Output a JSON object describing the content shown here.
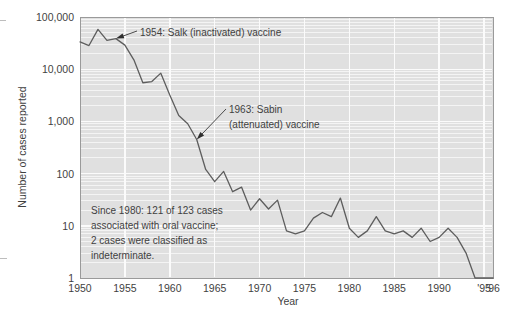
{
  "figure": {
    "title": "",
    "y_axis_title": "Number of cases reported",
    "x_axis_title": "Year"
  },
  "annotations": {
    "salk": "1954: Salk (inactivated) vaccine",
    "sabin_line1": "1963: Sabin",
    "sabin_line2": "(attenuated) vaccine",
    "note_line1": "Since 1980: 121 of 123 cases",
    "note_line2": "associated with oral vaccine;",
    "note_line3": "2 cases were classified as",
    "note_line4": "indeterminate."
  },
  "colors": {
    "plot_background": "#e0e0e0",
    "gridline": "#f4f4f4",
    "frame": "#9a9a9a",
    "series_line": "#5d5d5d",
    "text": "#3f3f3f",
    "page_background": "#ffffff"
  },
  "chart_data": {
    "type": "line",
    "title": "",
    "xlabel": "Year",
    "ylabel": "Number of cases reported",
    "yscale": "log",
    "ylim": [
      1,
      100000
    ],
    "xlim": [
      1950,
      1996
    ],
    "grid": true,
    "legend": "none",
    "ytick_labels": [
      "1",
      "10",
      "100",
      "1,000",
      "10,000",
      "100,000"
    ],
    "ytick_values": [
      1,
      10,
      100,
      1000,
      10000,
      100000
    ],
    "xtick_labels": [
      "1950",
      "1955",
      "1960",
      "1965",
      "1970",
      "1975",
      "1980",
      "1985",
      "1990",
      "'95",
      "'96"
    ],
    "xtick_values": [
      1950,
      1955,
      1960,
      1965,
      1970,
      1975,
      1980,
      1985,
      1990,
      1995,
      1996
    ],
    "series": [
      {
        "name": "Paralytic poliomyelitis cases reported",
        "x": [
          1950,
          1951,
          1952,
          1953,
          1954,
          1955,
          1956,
          1957,
          1958,
          1959,
          1960,
          1961,
          1962,
          1963,
          1964,
          1965,
          1966,
          1967,
          1968,
          1969,
          1970,
          1971,
          1972,
          1973,
          1974,
          1975,
          1976,
          1977,
          1978,
          1979,
          1980,
          1981,
          1982,
          1983,
          1984,
          1985,
          1986,
          1987,
          1988,
          1989,
          1990,
          1991,
          1992,
          1993,
          1994,
          1995,
          1996
        ],
        "values": [
          33300,
          28400,
          57900,
          35600,
          38500,
          28900,
          15100,
          5500,
          5800,
          8400,
          3200,
          1300,
          900,
          450,
          120,
          70,
          110,
          45,
          55,
          20,
          33,
          21,
          31,
          8,
          7,
          8,
          14,
          18,
          15,
          34,
          9,
          6,
          8,
          15,
          8,
          7,
          8,
          6,
          9,
          5,
          6,
          9,
          6,
          3,
          1,
          1,
          1
        ],
        "linecolor": "#5d5d5d",
        "linewidth": 1.3
      }
    ],
    "annotations": [
      {
        "text": "1954: Salk (inactivated) vaccine",
        "point_x": 1954,
        "point_y": 38500
      },
      {
        "text": "1963: Sabin (attenuated) vaccine",
        "point_x": 1963,
        "point_y": 450
      },
      {
        "text": "Since 1980: 121 of 123 cases associated with oral vaccine; 2 cases were classified as indeterminate.",
        "point_x": null,
        "point_y": null
      }
    ]
  }
}
